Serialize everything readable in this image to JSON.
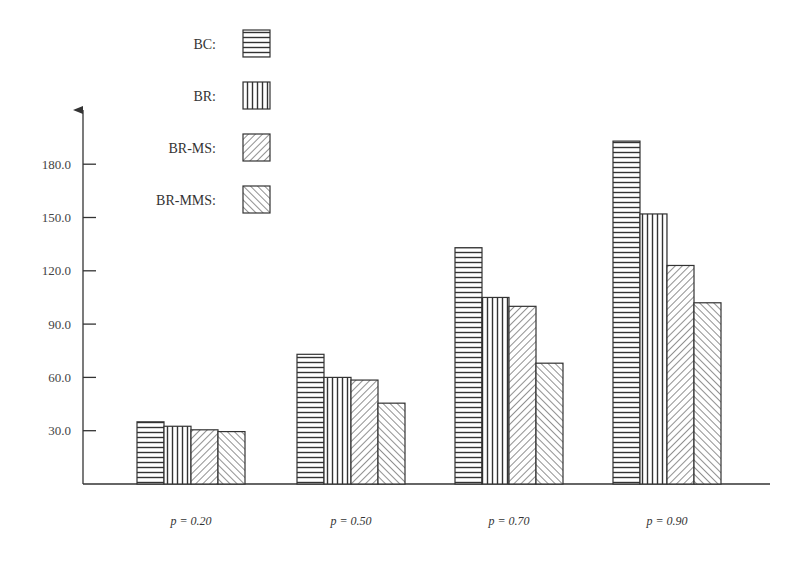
{
  "chart_data": {
    "type": "bar",
    "title": "",
    "xlabel": "",
    "ylabel": "",
    "categories": [
      "p = 0.20",
      "p = 0.50",
      "p = 0.70",
      "p = 0.90"
    ],
    "series": [
      {
        "name": "BC:",
        "pattern": "horizontal-lines",
        "values": [
          35,
          73,
          133,
          193
        ]
      },
      {
        "name": "BR:",
        "pattern": "vertical-lines",
        "values": [
          32.5,
          60,
          105,
          152
        ]
      },
      {
        "name": "BR-MS:",
        "pattern": "diagonal-down",
        "values": [
          30.5,
          58.5,
          100,
          123
        ]
      },
      {
        "name": "BR-MMS:",
        "pattern": "diagonal-up",
        "values": [
          29.5,
          45.5,
          68,
          102
        ]
      }
    ],
    "ylim": [
      0,
      200
    ],
    "yticks": [
      30,
      60,
      90,
      120,
      150,
      180
    ],
    "ytick_labels": [
      "30.0",
      "60.0",
      "90.0",
      "120.0",
      "150.0",
      "180.0"
    ],
    "grid": false,
    "legend_position": "top-left"
  },
  "colors": {
    "axis": "#333333",
    "bar_stroke": "#333333",
    "background": "#ffffff"
  }
}
